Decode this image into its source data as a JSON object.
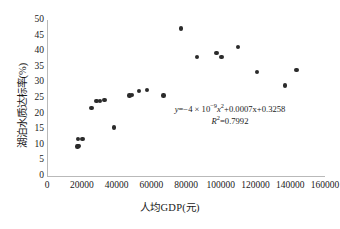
{
  "chart_data": {
    "type": "scatter",
    "title": "",
    "xlabel": "人均GDP(元)",
    "ylabel": "湖泊水质达标率(%)",
    "xlim": [
      0,
      160000
    ],
    "ylim": [
      0,
      50
    ],
    "xticks": [
      "0",
      "20000",
      "40000",
      "60000",
      "80000",
      "100000",
      "120000",
      "140000",
      "160000"
    ],
    "xtick_values": [
      0,
      20000,
      40000,
      60000,
      80000,
      100000,
      120000,
      140000,
      160000
    ],
    "yticks": [
      "0",
      "5",
      "10",
      "15",
      "20",
      "25",
      "30",
      "35",
      "40",
      "45",
      "50"
    ],
    "ytick_values": [
      0,
      5,
      10,
      15,
      20,
      25,
      30,
      35,
      40,
      45,
      50
    ],
    "grid": false,
    "legend": "none",
    "marker_color": "#2b2b2b",
    "line_color": "#111111",
    "points": [
      [
        17500,
        9.5
      ],
      [
        18200,
        9.6
      ],
      [
        18000,
        11.9
      ],
      [
        20500,
        11.8
      ],
      [
        25500,
        21.7
      ],
      [
        28500,
        24.1
      ],
      [
        30500,
        24.0
      ],
      [
        33000,
        24.4
      ],
      [
        38500,
        15.5
      ],
      [
        47500,
        25.8
      ],
      [
        49000,
        26.0
      ],
      [
        53000,
        27.2
      ],
      [
        57500,
        27.5
      ],
      [
        67000,
        25.8
      ],
      [
        77000,
        47.3
      ],
      [
        86500,
        38.1
      ],
      [
        97500,
        39.4
      ],
      [
        100500,
        38.1
      ],
      [
        110000,
        41.4
      ],
      [
        121000,
        33.4
      ],
      [
        137000,
        29.0
      ],
      [
        143500,
        33.9
      ]
    ],
    "trendline": {
      "type": "polynomial",
      "degree": 2,
      "a": -4e-09,
      "b": 0.0007,
      "c": 0.3258,
      "x_start": 17000,
      "x_end": 144000,
      "y_scale": 1000,
      "vertex_x": 87500
    },
    "annotation": {
      "equation_prefix": "y=−4 × 10",
      "equation_exp": "−9",
      "equation_mid": "x",
      "equation_sq": "2",
      "equation_tail": "+0.0007x+0.3258",
      "r2_label": "R",
      "r2_sup": "2",
      "r2_value": "=0.7992"
    }
  }
}
